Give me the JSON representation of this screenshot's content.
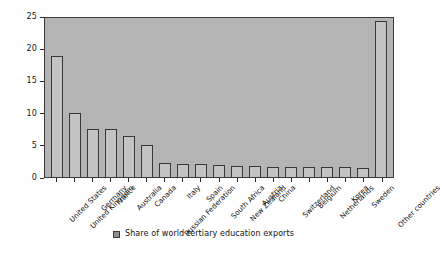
{
  "chart_data": {
    "type": "bar",
    "title": "",
    "xlabel": "",
    "ylabel": "",
    "ylim": [
      0,
      25
    ],
    "yticks": [
      0,
      5,
      10,
      15,
      20,
      25
    ],
    "grid": false,
    "legend_position": "bottom-center",
    "legend": [
      "Share of world tertiary education exports"
    ],
    "categories": [
      "United States",
      "United Kingdom",
      "Germany",
      "France",
      "Australia",
      "Canada",
      "Russian Federation",
      "Italy",
      "Spain",
      "South Africa",
      "New Zealand",
      "Austria",
      "China",
      "Switzerland",
      "Belgium",
      "Netherlands",
      "Korea",
      "Sweden",
      "Other countries"
    ],
    "values": [
      18.8,
      10.0,
      7.4,
      7.4,
      6.3,
      4.9,
      2.2,
      2.0,
      2.0,
      1.8,
      1.7,
      1.7,
      1.6,
      1.5,
      1.5,
      1.6,
      1.5,
      1.4,
      24.3
    ],
    "series": [
      {
        "name": "Share of world tertiary education exports",
        "values": [
          18.8,
          10.0,
          7.4,
          7.4,
          6.3,
          4.9,
          2.2,
          2.0,
          2.0,
          1.8,
          1.7,
          1.7,
          1.6,
          1.5,
          1.5,
          1.6,
          1.5,
          1.4,
          24.3
        ]
      }
    ],
    "colors": {
      "plot_background": "#b4b4b4",
      "bar_fill": "#c3c3c3",
      "bar_edge": "#383838",
      "axis": "#2b2b2b",
      "text": "#111111",
      "legend_swatch": "#8e8e8e",
      "page_background": "#ffffff"
    }
  }
}
